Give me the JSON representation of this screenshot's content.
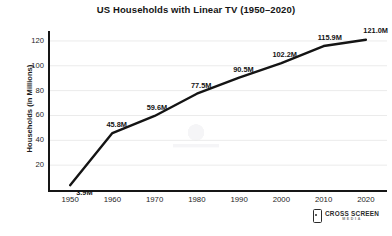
{
  "chart_data": {
    "type": "line",
    "title": "US Households with Linear TV (1950–2020)",
    "xlabel": "",
    "ylabel": "Households (in Millions)",
    "categories": [
      "1950",
      "1960",
      "1970",
      "1980",
      "1990",
      "2000",
      "2010",
      "2020"
    ],
    "x": [
      1950,
      1960,
      1970,
      1980,
      1990,
      2000,
      2010,
      2020
    ],
    "values": [
      3.9,
      45.8,
      59.6,
      77.5,
      90.5,
      102.2,
      115.9,
      121.0
    ],
    "point_labels": [
      "3.9M",
      "45.8M",
      "59.6M",
      "77.5M",
      "90.5M",
      "102.2M",
      "115.9M",
      "121.0M"
    ],
    "xlim": [
      1945,
      2025
    ],
    "ylim": [
      0,
      128
    ],
    "yticks": [
      20,
      40,
      60,
      80,
      100,
      120
    ],
    "ytick_labels": [
      "20",
      "40",
      "60",
      "80",
      "100",
      "120"
    ],
    "grid": "horizontal",
    "legend": "none",
    "series_color": "#141414",
    "grid_color": "#ebebeb",
    "axis_color": "#161616",
    "background": "#ffffff"
  },
  "branding": {
    "logo_main": "CROSS SCREEN",
    "logo_sub": "MEDIA",
    "logo_icon": "mobile-device-icon"
  }
}
